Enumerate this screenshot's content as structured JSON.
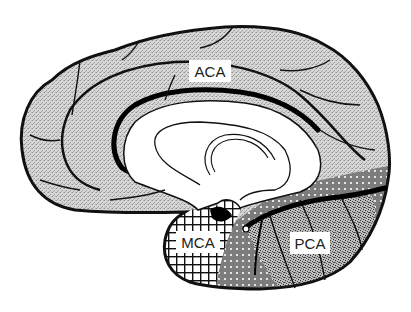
{
  "diagram": {
    "view": "medial sagittal hemisphere",
    "regions": [
      {
        "id": "aca",
        "label": "ACA",
        "fill_pattern": "fine-gray-stipple",
        "color": "#c8c8c8"
      },
      {
        "id": "mca",
        "label": "MCA",
        "fill_pattern": "crosshatch-grid",
        "color": "#000000"
      },
      {
        "id": "pca",
        "label": "PCA",
        "fill_pattern": "dense-black-stipple",
        "color": "#555555"
      },
      {
        "id": "watershed",
        "label": "",
        "fill_pattern": "dark-with-white-dots",
        "color": "#8a8a8a"
      }
    ],
    "labels": {
      "aca": "ACA",
      "mca": "MCA",
      "pca": "PCA"
    },
    "colors": {
      "outline": "#111111",
      "background": "#ffffff",
      "aca_fill": "#d0d0d0",
      "pca_fill": "#9a9a9a",
      "dot_fill": "#7a7a7a"
    }
  }
}
